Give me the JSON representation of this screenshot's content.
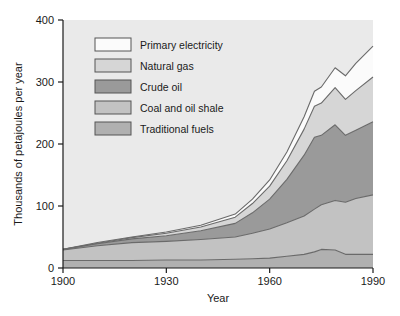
{
  "chart_data": {
    "type": "area",
    "stacked": true,
    "title": "",
    "xlabel": "Year",
    "ylabel": "Thousands of petajoules per year",
    "xlim": [
      1900,
      1990
    ],
    "ylim": [
      0,
      400
    ],
    "xticks": [
      1900,
      1930,
      1960,
      1990
    ],
    "yticks": [
      0,
      100,
      200,
      300,
      400
    ],
    "xtick_labels": [
      "1900",
      "1930",
      "1960",
      "1990"
    ],
    "ytick_labels": [
      "0",
      "100",
      "200",
      "300",
      "400"
    ],
    "grid": false,
    "legend_position": "top-left-inside",
    "x": [
      1900,
      1910,
      1920,
      1930,
      1940,
      1950,
      1955,
      1960,
      1965,
      1970,
      1973,
      1975,
      1979,
      1982,
      1985,
      1990
    ],
    "series": [
      {
        "name": "Traditional fuels",
        "color": "#b0b0b0",
        "values": [
          12,
          12,
          12,
          13,
          13,
          14,
          15,
          16,
          19,
          22,
          26,
          30,
          29,
          22,
          22,
          22
        ]
      },
      {
        "name": "Coal and oil shale",
        "color": "#c2c2c2",
        "values": [
          17,
          24,
          29,
          30,
          33,
          36,
          41,
          47,
          54,
          62,
          69,
          72,
          80,
          84,
          90,
          96
        ]
      },
      {
        "name": "Crude oil",
        "color": "#9a9a9a",
        "values": [
          1,
          3,
          6,
          9,
          14,
          22,
          33,
          48,
          70,
          98,
          116,
          112,
          122,
          108,
          110,
          118
        ]
      },
      {
        "name": "Natural gas",
        "color": "#d6d6d6",
        "values": [
          0,
          1,
          2,
          4,
          6,
          10,
          15,
          21,
          30,
          42,
          50,
          52,
          60,
          58,
          64,
          72
        ]
      },
      {
        "name": "Primary electricity",
        "color": "#fbfbfb",
        "values": [
          0,
          1,
          1,
          2,
          3,
          5,
          7,
          10,
          14,
          20,
          24,
          26,
          32,
          38,
          44,
          50
        ]
      }
    ],
    "totals_label": {
      "1900": 30,
      "1950": 87,
      "1990": 358
    }
  },
  "legend": {
    "items": [
      {
        "label": "Primary electricity",
        "swatch": "#fbfbfb"
      },
      {
        "label": "Natural gas",
        "swatch": "#d6d6d6"
      },
      {
        "label": "Crude oil",
        "swatch": "#9a9a9a"
      },
      {
        "label": "Coal and oil shale",
        "swatch": "#c2c2c2"
      },
      {
        "label": "Traditional fuels",
        "swatch": "#b0b0b0"
      }
    ]
  },
  "style": {
    "plot_background": "#eaeaea",
    "axis_color": "#1a1a1a",
    "outline_color": "#6a6a6a",
    "page_background": "#ffffff"
  }
}
